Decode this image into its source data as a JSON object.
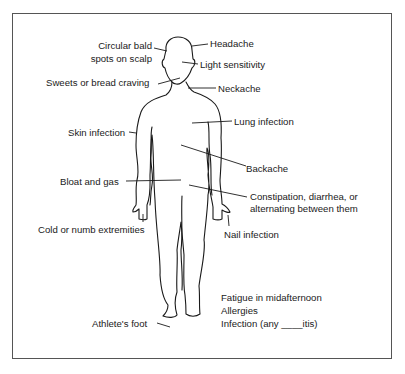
{
  "figure": {
    "type": "body-symptom-diagram",
    "border_color": "#555555",
    "line_color": "#1a1a1a",
    "labels": {
      "circular_bald_line1": "Circular bald",
      "circular_bald_line2": "spots on scalp",
      "headache": "Headache",
      "light_sensitivity": "Light sensitivity",
      "sweets_craving": "Sweets or bread craving",
      "neckache": "Neckache",
      "skin_infection": "Skin infection",
      "lung_infection": "Lung infection",
      "backache": "Backache",
      "bloat_gas": "Bloat and gas",
      "constipation_line1": "Constipation, diarrhea, or",
      "constipation_line2": "alternating between them",
      "cold_extremities": "Cold or numb extremities",
      "nail_infection": "Nail infection",
      "athletes_foot": "Athlete's foot"
    },
    "general_symptoms": [
      "Fatigue in midafternoon",
      "Allergies",
      "Infection (any ____itis)"
    ]
  }
}
